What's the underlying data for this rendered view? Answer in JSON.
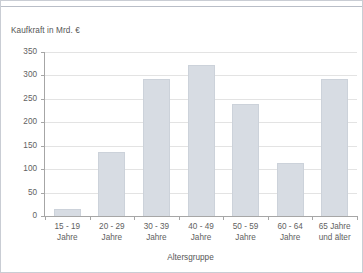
{
  "chart_data": {
    "type": "bar",
    "title": "",
    "xlabel": "Altersgruppe",
    "ylabel": "Kaufkraft in Mrd. €",
    "categories": [
      "15 - 19\nJahre",
      "20 - 29\nJahre",
      "30 - 39\nJahre",
      "40 - 49\nJahre",
      "50 - 59\nJahre",
      "60 - 64\nJahre",
      "65 Jahre\nund älter"
    ],
    "category_lines": [
      [
        "15 - 19",
        "Jahre"
      ],
      [
        "20 - 29",
        "Jahre"
      ],
      [
        "30 - 39",
        "Jahre"
      ],
      [
        "40 - 49",
        "Jahre"
      ],
      [
        "50 - 59",
        "Jahre"
      ],
      [
        "60 - 64",
        "Jahre"
      ],
      [
        "65 Jahre",
        "und älter"
      ]
    ],
    "values": [
      14,
      136,
      292,
      323,
      238,
      113,
      292
    ],
    "ylim": [
      0,
      350
    ],
    "yticks": [
      0,
      50,
      100,
      150,
      200,
      250,
      300,
      350
    ],
    "ytick_labels": [
      "0",
      "50",
      "100",
      "150",
      "200",
      "250",
      "300",
      "350"
    ],
    "grid": "horizontal",
    "legend": "none",
    "bar_color": "#d7dce3",
    "bar_border_color": "#ccd2da",
    "gridline_color": "#e3e3e3",
    "axis_color": "#a6a6a6",
    "text_color": "#616161"
  }
}
